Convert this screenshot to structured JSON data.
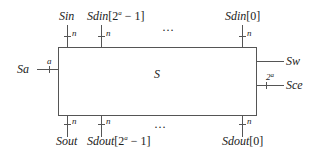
{
  "diagram": {
    "block": {
      "label": "S"
    },
    "inputs_top": [
      {
        "name": "Sin",
        "width": "n"
      },
      {
        "name": "Sdin",
        "index_prefix": "[2",
        "index_sup": "a",
        "index_suffix": " − 1]",
        "width": "n"
      },
      {
        "name": "Sdin",
        "index": "[0]",
        "width": "n"
      }
    ],
    "top_ellipsis": "…",
    "outputs_bottom": [
      {
        "name": "Sout",
        "width": "n"
      },
      {
        "name": "Sdout",
        "index_prefix": "[2",
        "index_sup": "a",
        "index_suffix": " − 1]",
        "width": "n"
      },
      {
        "name": "Sdout",
        "index": "[0]",
        "width": "n"
      }
    ],
    "bottom_ellipsis": "…",
    "left_input": {
      "name": "Sa",
      "width": "a"
    },
    "right_ports": [
      {
        "name": "Sw"
      },
      {
        "name": "Sce",
        "width_base": "2",
        "width_sup": "a"
      }
    ]
  }
}
